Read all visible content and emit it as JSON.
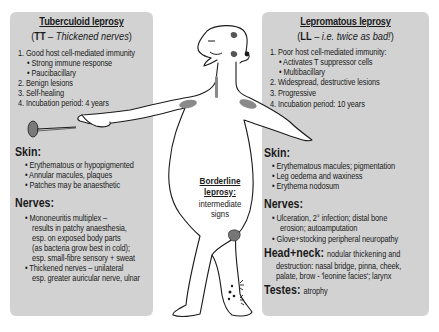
{
  "left": {
    "title": "Tuberculoid leprosy",
    "subtitle_abbr": "TT",
    "subtitle_dash": " – ",
    "subtitle_desc": "Thickened nerves",
    "list": [
      "1. Good host cell-mediated immunity",
      "• Strong immune response",
      "• Paucibacillary",
      "2. Benign lesions",
      "3. Self-healing",
      "4. Incubation period: 4 years"
    ],
    "skin_heading": "Skin:",
    "skin": [
      "• Erythematous or hypopigmented",
      "• Annular macules, plaques",
      "• Patches may be anaesthetic"
    ],
    "nerves_heading": "Nerves:",
    "nerves": [
      "• Mononeuritis multiplex –",
      "results in patchy anaesthesia,",
      "esp. on exposed body parts",
      "(as bacteria grow best in cold);",
      "esp. small-fibre sensory + sweat",
      "• Thickened nerves – unilateral",
      "esp. greater auricular nerve, ulnar"
    ]
  },
  "right": {
    "title": "Lepromatous leprosy",
    "subtitle_abbr": "LL",
    "subtitle_dash": " – ",
    "subtitle_desc": "i.e. twice as bad!",
    "list": [
      "1. Poor host cell-mediated immunity:",
      "• Activates T suppressor cells",
      "• Multibacillary",
      "2. Widespread, destructive lesions",
      "3. Progressive",
      "4. Incubation period: 10 years"
    ],
    "skin_heading": "Skin:",
    "skin": [
      "• Erythematous macules; pigmentation",
      "• Leg oedema and waxiness",
      "• Erythema nodosum"
    ],
    "nerves_heading": "Nerves:",
    "nerves": [
      "• Ulceration, 2° infection; distal bone",
      "erosion; autoamputation",
      "• Glove+stocking peripheral neuropathy"
    ],
    "head_heading": "Head+neck:",
    "head": [
      "nodular thickening and",
      "destruction: nasal bridge, pinna, cheek,",
      "palate, brow - 'leonine facies'; larynx"
    ],
    "testes_heading": "Testes:",
    "testes": "atrophy"
  },
  "center": {
    "title_line1": "Borderline",
    "title_line2": "leprosy:",
    "desc_line1": "intermediate",
    "desc_line2": "signs"
  },
  "colors": {
    "panel": "#d2d2d2",
    "lesion": "#8a8a8a",
    "pin_head": "#7a7a7a",
    "outline": "#1a1a1a"
  },
  "icons": [
    "pin-icon",
    "human-figure-illustration",
    "nodule-icon",
    "ulcer-icon"
  ]
}
